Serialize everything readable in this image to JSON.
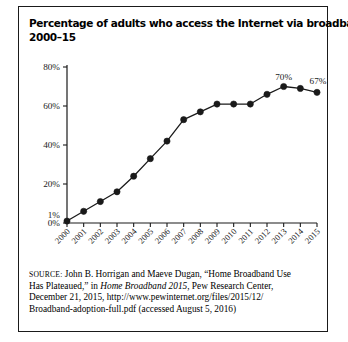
{
  "figure": {
    "title_lines": [
      "Percentage of adults who access the Internet via broadband,",
      "2000–15"
    ],
    "border_color": "#1a1a1a",
    "background_color": "#ffffff"
  },
  "source": {
    "label": "SOURCE:",
    "lines": [
      {
        "segments": [
          {
            "text": "SOURCE:",
            "style": "smallcaps"
          },
          {
            "text": " John B. Horrigan and Maeve Dugan, “Home Broadband Use",
            "style": "normal"
          }
        ]
      },
      {
        "segments": [
          {
            "text": "Has Plateaued,” in ",
            "style": "normal"
          },
          {
            "text": "Home Broadband 2015",
            "style": "italic"
          },
          {
            "text": ", Pew Research Center,",
            "style": "normal"
          }
        ]
      },
      {
        "segments": [
          {
            "text": "December 21, 2015, http://www.pewinternet.org/files/2015/12/",
            "style": "normal"
          }
        ]
      },
      {
        "segments": [
          {
            "text": "Broadband-adoption-full.pdf (accessed August 5, 2016)",
            "style": "normal"
          }
        ]
      }
    ]
  },
  "chart_data": {
    "type": "line",
    "title": "Percentage of adults who access the Internet via broadband, 2000–15",
    "xlabel": "",
    "ylabel": "",
    "ylim": [
      0,
      80
    ],
    "yticks": [
      0,
      20,
      40,
      60,
      80
    ],
    "ytick_labels": [
      "0%",
      "20%",
      "40%",
      "60%",
      "80%"
    ],
    "grid": false,
    "legend": "none",
    "marker": "filled-circle",
    "line_color": "#1a1a1a",
    "marker_color": "#1a1a1a",
    "categories": [
      "2000",
      "2001",
      "2002",
      "2003",
      "2004",
      "2005",
      "2006",
      "2007",
      "2008",
      "2009",
      "2010",
      "2011",
      "2012",
      "2013",
      "2014",
      "2015"
    ],
    "values": [
      1,
      6,
      11,
      16,
      24,
      33,
      42,
      53,
      57,
      61,
      61,
      61,
      66,
      70,
      69,
      67
    ],
    "data_labels": [
      {
        "category": "2000",
        "value": 1,
        "text": "1%",
        "position": "left"
      },
      {
        "category": "2013",
        "value": 70,
        "text": "70%",
        "position": "above"
      },
      {
        "category": "2015",
        "value": 67,
        "text": "67%",
        "position": "above-right"
      }
    ]
  }
}
